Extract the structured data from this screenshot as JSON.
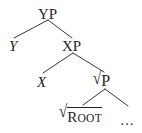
{
  "figure": {
    "name": "syntactic-tree",
    "type": "constituency-tree",
    "width": 142,
    "height": 133,
    "background_color": "#ffffff",
    "line_color": "#231f20",
    "text_color": "#231f20"
  },
  "nodes": {
    "yp": {
      "label": "YP",
      "style": "upright",
      "x": 48,
      "y": 14
    },
    "y": {
      "label": "Y",
      "style": "italic",
      "x": 14,
      "y": 46
    },
    "xp": {
      "label": "XP",
      "style": "upright",
      "x": 72,
      "y": 46
    },
    "x": {
      "label": "X",
      "style": "italic",
      "x": 42,
      "y": 82
    },
    "root_p": {
      "radical": "√",
      "label": "P",
      "style": "upright",
      "x": 105,
      "y": 80
    },
    "root": {
      "radical": "√",
      "label_first": "R",
      "label_rest": "OOT",
      "style": "small-caps-overlined",
      "x": 82,
      "y": 113
    },
    "ellipsis": {
      "label": "…",
      "style": "upright",
      "x": 127,
      "y": 118
    }
  },
  "edges": [
    {
      "from": "yp",
      "to": "y",
      "x1": 48,
      "y1": 20,
      "x2": 14,
      "y2": 38
    },
    {
      "from": "yp",
      "to": "xp",
      "x1": 48,
      "y1": 20,
      "x2": 72,
      "y2": 38
    },
    {
      "from": "xp",
      "to": "x",
      "x1": 73,
      "y1": 53,
      "x2": 43,
      "y2": 73
    },
    {
      "from": "xp",
      "to": "root_p",
      "x1": 73,
      "y1": 53,
      "x2": 104,
      "y2": 72
    },
    {
      "from": "root_p",
      "to": "root",
      "x1": 105,
      "y1": 89,
      "x2": 82,
      "y2": 105
    },
    {
      "from": "root_p",
      "to": "ellipsis",
      "x1": 105,
      "y1": 89,
      "x2": 128,
      "y2": 106
    }
  ],
  "glyphs": {
    "radical": "√",
    "ellipsis": "…"
  }
}
